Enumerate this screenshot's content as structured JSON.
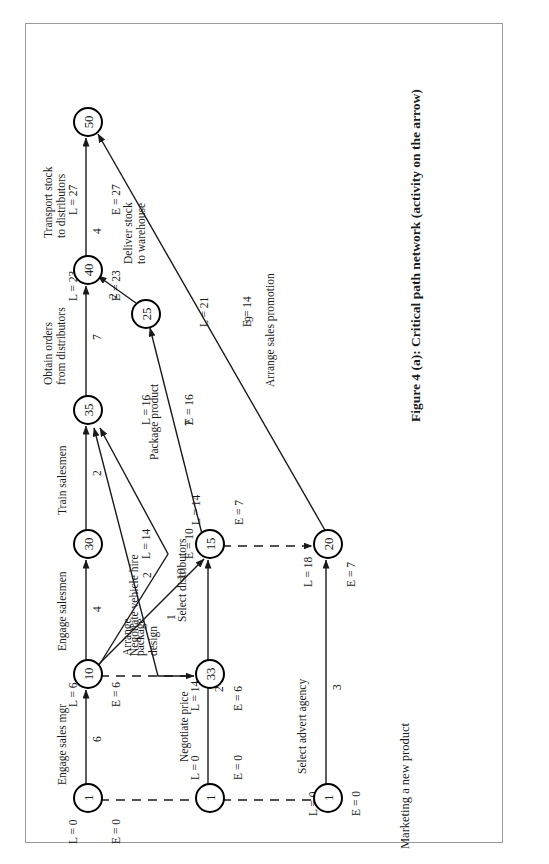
{
  "figure": {
    "caption": "Figure 4 (a): Critical path network (activity on the arrow)",
    "title": "Marketing a new product"
  },
  "diagram": {
    "nodes": [
      {
        "id": "start1",
        "label": "1",
        "L": "L = 0",
        "E": "E = 0"
      },
      {
        "id": "start2",
        "label": "1",
        "L": "L = 0",
        "E": "E = 0"
      },
      {
        "id": "start3",
        "label": "1",
        "L": "L = 0",
        "E": "E = 0"
      },
      {
        "id": "n10",
        "label": "10",
        "L": "L = 6",
        "E": "E = 6"
      },
      {
        "id": "n33",
        "label": "33",
        "L": "L = 14",
        "E": "E = 6"
      },
      {
        "id": "n30",
        "label": "30",
        "L": "L = 14",
        "E": "E = 10"
      },
      {
        "id": "n35",
        "label": "35",
        "L": "L = 16",
        "E": "E = 16"
      },
      {
        "id": "n15",
        "label": "15",
        "L": "L = 14",
        "E": "E = 7"
      },
      {
        "id": "n20",
        "label": "20",
        "L": "L = 18",
        "E": "E = 7"
      },
      {
        "id": "n25",
        "label": "25",
        "L": "L = 21",
        "E": "E = 14"
      },
      {
        "id": "n40",
        "label": "40",
        "L": "L = 23",
        "E": "E = 23"
      },
      {
        "id": "n50",
        "label": "50",
        "L": "L = 27",
        "E": "E = 27"
      }
    ],
    "activities": [
      {
        "id": "a1",
        "from": "start1",
        "to": "n10",
        "label": "Engage sales mgr",
        "duration": "6",
        "style": "solid"
      },
      {
        "id": "a2",
        "from": "n10",
        "to": "n30",
        "label": "Engage salesmen",
        "duration": "4",
        "style": "solid"
      },
      {
        "id": "a3",
        "from": "n30",
        "to": "n35",
        "label": "Train salesmen",
        "duration": "2",
        "style": "solid"
      },
      {
        "id": "a4",
        "from": "n10",
        "to": "n35",
        "label": "Select distributors",
        "duration": "10",
        "style": "solid"
      },
      {
        "id": "a5",
        "from": "n33",
        "to": "n35",
        "label": "Negotiate vehicle hire",
        "duration": "2",
        "style": "solid"
      },
      {
        "id": "a6",
        "from": "n10",
        "to": "n33",
        "label": "",
        "duration": "",
        "style": "dashed"
      },
      {
        "id": "a7",
        "from": "n10",
        "to": "n15",
        "label": "Arrange\npackage\ndesign",
        "duration": "1",
        "style": "solid"
      },
      {
        "id": "a8",
        "from": "start2",
        "to": "n15",
        "label": "Negotiate price",
        "duration": "2",
        "style": "solid"
      },
      {
        "id": "a9",
        "from": "n15",
        "to": "n20",
        "label": "",
        "duration": "",
        "style": "dashed"
      },
      {
        "id": "a10",
        "from": "start3",
        "to": "n20",
        "label": "Select advert agency",
        "duration": "3",
        "style": "solid"
      },
      {
        "id": "a11",
        "from": "n15",
        "to": "n25",
        "label": "Package product",
        "duration": "7",
        "style": "solid"
      },
      {
        "id": "a12",
        "from": "n25",
        "to": "n40",
        "label": "Deliver stock\nto warehouse",
        "duration": "2",
        "style": "solid"
      },
      {
        "id": "a13",
        "from": "n35",
        "to": "n40",
        "label": "Obtain orders\nfrom distributors",
        "duration": "7",
        "style": "solid"
      },
      {
        "id": "a14",
        "from": "n40",
        "to": "n50",
        "label": "Transport stock\nto distributors",
        "duration": "4",
        "style": "solid"
      },
      {
        "id": "a15",
        "from": "n20",
        "to": "n50",
        "label": "Arrange sales promotion",
        "duration": "9",
        "style": "solid"
      },
      {
        "id": "a16",
        "from": "start1",
        "to": "start2",
        "label": "",
        "duration": "",
        "style": "dashed"
      },
      {
        "id": "a17",
        "from": "start2",
        "to": "start3",
        "label": "",
        "duration": "",
        "style": "dashed"
      }
    ]
  },
  "colors": {
    "ink": "#1a1a1a",
    "frame": "#9a9a9a",
    "background": "#ffffff"
  }
}
